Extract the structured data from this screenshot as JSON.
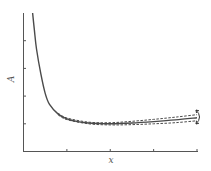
{
  "chart_data": {
    "type": "line",
    "title": "",
    "xlabel": "x",
    "ylabel": "A",
    "xlim": [
      0,
      4
    ],
    "ylim": [
      0,
      5
    ],
    "x_ticks": [
      1,
      2,
      3,
      4
    ],
    "y_ticks": [
      1,
      2,
      3,
      4
    ],
    "tick_labels_shown": false,
    "grid": false,
    "legend": null,
    "series": [
      {
        "name": "fit",
        "style": "solid",
        "x": [
          0.21,
          0.25,
          0.3,
          0.4,
          0.5,
          0.6,
          0.8,
          1.0,
          1.25,
          1.5,
          1.75,
          2.0,
          2.5,
          3.0,
          3.5,
          4.0
        ],
        "y": [
          5.0,
          4.4,
          3.7,
          2.8,
          2.1,
          1.7,
          1.35,
          1.18,
          1.08,
          1.03,
          1.01,
          1.0,
          1.03,
          1.08,
          1.14,
          1.22
        ]
      },
      {
        "name": "upper bound",
        "style": "dashed",
        "x": [
          0.8,
          1.0,
          1.5,
          2.0,
          2.5,
          3.0,
          3.5,
          4.0
        ],
        "y": [
          1.38,
          1.21,
          1.06,
          1.04,
          1.09,
          1.16,
          1.24,
          1.33
        ]
      },
      {
        "name": "lower bound",
        "style": "dashed",
        "x": [
          0.8,
          1.0,
          1.5,
          2.0,
          2.5,
          3.0,
          3.5,
          4.0
        ],
        "y": [
          1.32,
          1.15,
          1.0,
          0.96,
          0.97,
          1.0,
          1.04,
          1.11
        ]
      }
    ],
    "annotations": [
      {
        "type": "curved-double-arrow",
        "x": 4.05,
        "y_range": [
          1.0,
          1.45
        ],
        "meaning": "spread of bounds"
      }
    ]
  },
  "labels": {
    "x": "x",
    "y": "A"
  }
}
